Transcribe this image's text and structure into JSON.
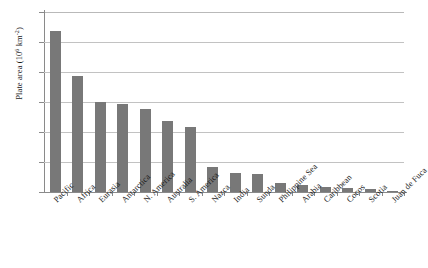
{
  "chart_data": {
    "type": "bar",
    "title": "",
    "xlabel": "",
    "ylabel": "Plate area (10⁶ km²)",
    "ylabel_text": "Plate area (10",
    "ylabel_exp": "6",
    "ylabel_tail": " km",
    "ylabel_exp2": "-2",
    "ylim": [
      0,
      120
    ],
    "yticks": [
      0,
      20,
      40,
      60,
      80,
      100,
      120
    ],
    "ytick_labels": [
      "0",
      "20",
      "40",
      "60",
      "80",
      "100",
      "120"
    ],
    "grid": true,
    "legend": "none",
    "bar_color": "#787878",
    "categories": [
      "Pacific",
      "Africa",
      "Eurasia",
      "Antarctica",
      "N. America",
      "Australia",
      "S. America",
      "Nazca",
      "India",
      "Sunda",
      "Philippine Sea",
      "Arabia",
      "Caribbean",
      "Cocos",
      "Scotia",
      "Juan de Fuca"
    ],
    "values": [
      107.5,
      77.5,
      60.0,
      58.5,
      55.5,
      47.5,
      43.5,
      17.0,
      13.0,
      12.0,
      6.0,
      5.0,
      3.5,
      3.0,
      1.8,
      0.4
    ]
  }
}
